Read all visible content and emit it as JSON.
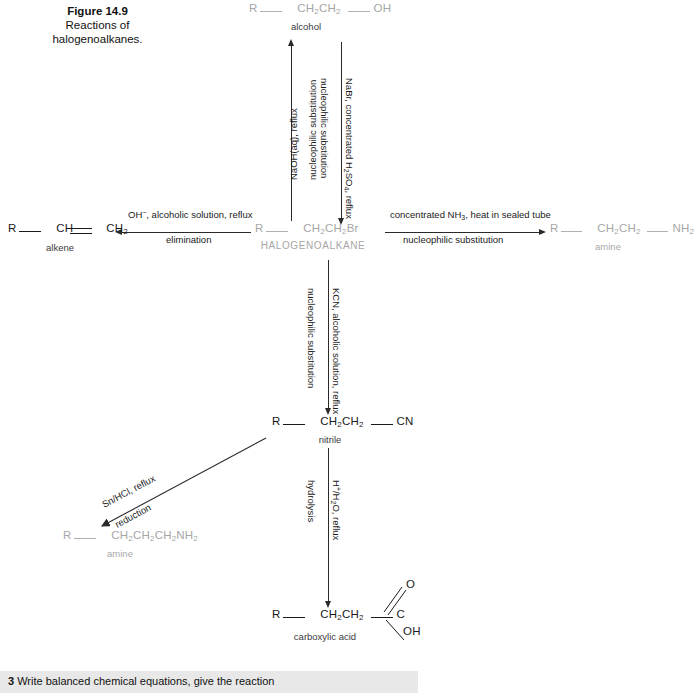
{
  "figure": {
    "number": "Figure 14.9",
    "caption": "Reactions of halogenoalkanes."
  },
  "species": {
    "alcohol": {
      "r": "R",
      "chain": "CH2CH2",
      "group": "OH",
      "label": "alcohol"
    },
    "halogenoalkane": {
      "r": "R",
      "chain": "CH2CH2Br",
      "label": "HALOGENOALKANE"
    },
    "alkene": {
      "r": "R",
      "left": "CH",
      "right": "CH2",
      "label": "alkene"
    },
    "amine_right": {
      "r": "R",
      "chain": "CH2CH2",
      "group": "NH2",
      "label": "amine"
    },
    "nitrile": {
      "r": "R",
      "chain": "CH2CH2",
      "group": "CN",
      "label": "nitrile"
    },
    "amine_bottom_left": {
      "r": "R",
      "chain": "CH2CH2CH2NH2",
      "label": "amine"
    },
    "carboxylic_acid": {
      "r": "R",
      "chain": "CH2CH2",
      "carbon": "C",
      "double_bond_o": "O",
      "hydroxyl": "OH",
      "label": "carboxylic acid"
    }
  },
  "reactions": {
    "to_alcohol": {
      "reagents": "NaOH(aq), reflux",
      "type": "nucleophilic substitution",
      "direction": "up"
    },
    "from_alcohol": {
      "reagents": "NaBr, concentrated H2SO4, reflux",
      "type": "nucleophilic substitution",
      "direction": "down"
    },
    "to_alkene": {
      "reagents": "OH-, alcoholic solution, reflux",
      "type": "elimination",
      "direction": "left"
    },
    "to_amine": {
      "reagents": "concentrated NH3, heat in sealed tube",
      "type": "nucleophilic substitution",
      "direction": "right"
    },
    "to_nitrile": {
      "reagents": "KCN, alcoholic solution, reflux",
      "type": "nucleophilic substitution",
      "direction": "down"
    },
    "to_amine_reduction": {
      "reagents": "Sn/HCl, reflux",
      "type": "reduction",
      "direction": "diagonal-down-left"
    },
    "to_carboxylic_acid": {
      "reagents": "H+/H2O, reflux",
      "type": "hydrolysis",
      "direction": "down"
    }
  },
  "bottom_question": {
    "number": "3",
    "text": "Write balanced chemical equations, give the reaction"
  },
  "colors": {
    "ink": "#1a1a1a",
    "faded": "#a6a6a6",
    "band": "#e8e8e8"
  }
}
